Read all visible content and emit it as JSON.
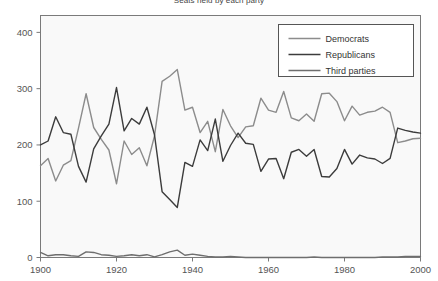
{
  "chart_data": {
    "type": "line",
    "title": "Seats held by each party",
    "xlabel": "",
    "ylabel": "",
    "xlim": [
      1900,
      2000
    ],
    "ylim": [
      0,
      430
    ],
    "grid": false,
    "legend_position": "top-right",
    "xticks": [
      "1900",
      "1920",
      "1940",
      "1960",
      "1980",
      "2000"
    ],
    "xtick_values": [
      1900,
      1920,
      1940,
      1960,
      1980,
      2000
    ],
    "yticks": [
      "0",
      "100",
      "200",
      "300",
      "400"
    ],
    "ytick_values": [
      0,
      100,
      200,
      300,
      400
    ],
    "x": [
      1900,
      1902,
      1904,
      1906,
      1908,
      1910,
      1912,
      1914,
      1916,
      1918,
      1920,
      1922,
      1924,
      1926,
      1928,
      1930,
      1932,
      1934,
      1936,
      1938,
      1940,
      1942,
      1944,
      1946,
      1948,
      1950,
      1952,
      1954,
      1956,
      1958,
      1960,
      1962,
      1964,
      1966,
      1968,
      1970,
      1972,
      1974,
      1976,
      1978,
      1980,
      1982,
      1984,
      1986,
      1988,
      1990,
      1992,
      1994,
      1996,
      1998,
      2000
    ],
    "series": [
      {
        "name": "Democrats",
        "color": "#8c8c8c",
        "values": [
          163,
          176,
          136,
          164,
          172,
          230,
          291,
          231,
          210,
          191,
          131,
          207,
          183,
          195,
          163,
          216,
          313,
          322,
          334,
          262,
          267,
          222,
          242,
          188,
          263,
          234,
          213,
          232,
          234,
          283,
          262,
          258,
          295,
          248,
          243,
          255,
          242,
          291,
          292,
          277,
          243,
          269,
          253,
          258,
          260,
          267,
          258,
          204,
          207,
          211,
          212
        ]
      },
      {
        "name": "Republicans",
        "color": "#3c3c3c",
        "values": [
          200,
          207,
          250,
          222,
          219,
          162,
          134,
          193,
          216,
          237,
          302,
          225,
          247,
          237,
          267,
          218,
          117,
          103,
          89,
          169,
          162,
          209,
          190,
          246,
          171,
          199,
          221,
          203,
          201,
          153,
          175,
          176,
          140,
          187,
          192,
          180,
          192,
          144,
          143,
          158,
          192,
          166,
          182,
          177,
          175,
          167,
          176,
          230,
          226,
          223,
          221
        ]
      },
      {
        "name": "Third parties",
        "color": "#6e6e6e",
        "values": [
          9,
          3,
          5,
          5,
          3,
          2,
          10,
          9,
          5,
          4,
          2,
          3,
          5,
          3,
          5,
          1,
          5,
          10,
          13,
          4,
          6,
          4,
          2,
          1,
          1,
          2,
          1,
          0,
          0,
          0,
          0,
          0,
          0,
          0,
          0,
          0,
          1,
          0,
          0,
          0,
          0,
          0,
          0,
          0,
          0,
          1,
          1,
          1,
          2,
          2,
          2
        ]
      }
    ]
  }
}
